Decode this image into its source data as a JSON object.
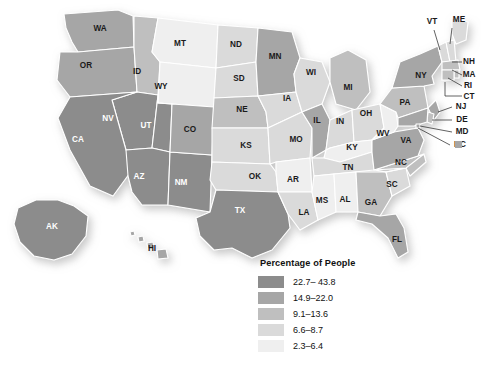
{
  "legend": {
    "title": "Percentage of People",
    "items": [
      {
        "label": "22.7– 43.8",
        "color": "#8c8c8c"
      },
      {
        "label": "14.9–22.0",
        "color": "#a6a6a6"
      },
      {
        "label": "9.1–13.6",
        "color": "#bfbfbf"
      },
      {
        "label": "6.6–8.7",
        "color": "#dadada"
      },
      {
        "label": "2.3–6.4",
        "color": "#efefef"
      }
    ]
  },
  "chart_data": {
    "type": "choropleth",
    "title": "Percentage of People",
    "xlabel": "",
    "ylabel": "",
    "units": "percent",
    "bins": [
      {
        "label": "22.7– 43.8",
        "min": 22.7,
        "max": 43.8,
        "color": "#8c8c8c"
      },
      {
        "label": "14.9–22.0",
        "min": 14.9,
        "max": 22.0,
        "color": "#a6a6a6"
      },
      {
        "label": "9.1–13.6",
        "min": 9.1,
        "max": 13.6,
        "color": "#bfbfbf"
      },
      {
        "label": "6.6–8.7",
        "min": 6.6,
        "max": 8.7,
        "color": "#dadada"
      },
      {
        "label": "2.3–6.4",
        "min": 2.3,
        "max": 6.4,
        "color": "#efefef"
      }
    ],
    "legend_position": "bottom-center",
    "grid": false,
    "regions": [
      {
        "code": "WA",
        "bin": 1
      },
      {
        "code": "OR",
        "bin": 1
      },
      {
        "code": "ID",
        "bin": 2
      },
      {
        "code": "MT",
        "bin": 4
      },
      {
        "code": "WY",
        "bin": 4
      },
      {
        "code": "CA",
        "bin": 0
      },
      {
        "code": "NV",
        "bin": 0
      },
      {
        "code": "UT",
        "bin": 0
      },
      {
        "code": "AZ",
        "bin": 0
      },
      {
        "code": "NM",
        "bin": 0
      },
      {
        "code": "CO",
        "bin": 1
      },
      {
        "code": "ND",
        "bin": 3
      },
      {
        "code": "SD",
        "bin": 3
      },
      {
        "code": "NE",
        "bin": 2
      },
      {
        "code": "KS",
        "bin": 3
      },
      {
        "code": "OK",
        "bin": 3
      },
      {
        "code": "TX",
        "bin": 0
      },
      {
        "code": "MN",
        "bin": 1
      },
      {
        "code": "IA",
        "bin": 3
      },
      {
        "code": "MO",
        "bin": 3
      },
      {
        "code": "AR",
        "bin": 4
      },
      {
        "code": "LA",
        "bin": 3
      },
      {
        "code": "WI",
        "bin": 3
      },
      {
        "code": "IL",
        "bin": 1
      },
      {
        "code": "MI",
        "bin": 2
      },
      {
        "code": "IN",
        "bin": 3
      },
      {
        "code": "OH",
        "bin": 3
      },
      {
        "code": "KY",
        "bin": 4
      },
      {
        "code": "TN",
        "bin": 3
      },
      {
        "code": "MS",
        "bin": 4
      },
      {
        "code": "AL",
        "bin": 4
      },
      {
        "code": "GA",
        "bin": 2
      },
      {
        "code": "FL",
        "bin": 1
      },
      {
        "code": "SC",
        "bin": 3
      },
      {
        "code": "NC",
        "bin": 2
      },
      {
        "code": "VA",
        "bin": 1
      },
      {
        "code": "WV",
        "bin": 4
      },
      {
        "code": "PA",
        "bin": 2
      },
      {
        "code": "NY",
        "bin": 1
      },
      {
        "code": "ME",
        "bin": 3
      },
      {
        "code": "VT",
        "bin": 3
      },
      {
        "code": "NH",
        "bin": 3
      },
      {
        "code": "MA",
        "bin": 2
      },
      {
        "code": "RI",
        "bin": 2
      },
      {
        "code": "CT",
        "bin": 2
      },
      {
        "code": "NJ",
        "bin": 1
      },
      {
        "code": "DE",
        "bin": 2
      },
      {
        "code": "MD",
        "bin": 1
      },
      {
        "code": "DC",
        "bin": 1
      },
      {
        "code": "AK",
        "bin": 0
      },
      {
        "code": "HI",
        "bin": 1
      }
    ]
  },
  "map": {
    "labels": [
      {
        "code": "WA",
        "x": 100,
        "y": 29
      },
      {
        "code": "OR",
        "x": 86,
        "y": 66
      },
      {
        "code": "ID",
        "x": 137,
        "y": 72
      },
      {
        "code": "MT",
        "x": 180,
        "y": 44
      },
      {
        "code": "WY",
        "x": 161,
        "y": 87
      },
      {
        "code": "NV",
        "x": 108,
        "y": 119
      },
      {
        "code": "CA",
        "x": 78,
        "y": 140
      },
      {
        "code": "UT",
        "x": 146,
        "y": 126
      },
      {
        "code": "AZ",
        "x": 139,
        "y": 177
      },
      {
        "code": "NM",
        "x": 181,
        "y": 183
      },
      {
        "code": "CO",
        "x": 190,
        "y": 130
      },
      {
        "code": "ND",
        "x": 236,
        "y": 45
      },
      {
        "code": "SD",
        "x": 239,
        "y": 79
      },
      {
        "code": "NE",
        "x": 242,
        "y": 110
      },
      {
        "code": "KS",
        "x": 246,
        "y": 146
      },
      {
        "code": "OK",
        "x": 255,
        "y": 177
      },
      {
        "code": "TX",
        "x": 240,
        "y": 211
      },
      {
        "code": "MN",
        "x": 275,
        "y": 57
      },
      {
        "code": "IA",
        "x": 287,
        "y": 99
      },
      {
        "code": "MO",
        "x": 296,
        "y": 140
      },
      {
        "code": "AR",
        "x": 293,
        "y": 180
      },
      {
        "code": "LA",
        "x": 304,
        "y": 213
      },
      {
        "code": "WI",
        "x": 311,
        "y": 73
      },
      {
        "code": "IL",
        "x": 317,
        "y": 121
      },
      {
        "code": "MI",
        "x": 348,
        "y": 88
      },
      {
        "code": "IN",
        "x": 340,
        "y": 122
      },
      {
        "code": "OH",
        "x": 366,
        "y": 114
      },
      {
        "code": "KY",
        "x": 352,
        "y": 148
      },
      {
        "code": "TN",
        "x": 348,
        "y": 168
      },
      {
        "code": "MS",
        "x": 322,
        "y": 201
      },
      {
        "code": "AL",
        "x": 345,
        "y": 200
      },
      {
        "code": "GA",
        "x": 371,
        "y": 203
      },
      {
        "code": "FL",
        "x": 397,
        "y": 240
      },
      {
        "code": "SC",
        "x": 392,
        "y": 185
      },
      {
        "code": "NC",
        "x": 401,
        "y": 163
      },
      {
        "code": "VA",
        "x": 406,
        "y": 141
      },
      {
        "code": "WV",
        "x": 383,
        "y": 134
      },
      {
        "code": "PA",
        "x": 405,
        "y": 103
      },
      {
        "code": "NY",
        "x": 421,
        "y": 76
      },
      {
        "code": "AK",
        "x": 52,
        "y": 227
      },
      {
        "code": "HI",
        "x": 152,
        "y": 249
      }
    ],
    "callouts": [
      {
        "code": "VT",
        "x": 432,
        "y": 22
      },
      {
        "code": "ME",
        "x": 459,
        "y": 20
      },
      {
        "code": "NH",
        "x": 469,
        "y": 62
      },
      {
        "code": "MA",
        "x": 469,
        "y": 75
      },
      {
        "code": "RI",
        "x": 468,
        "y": 86
      },
      {
        "code": "CT",
        "x": 469,
        "y": 97
      },
      {
        "code": "NJ",
        "x": 461,
        "y": 107
      },
      {
        "code": "DE",
        "x": 462,
        "y": 120
      },
      {
        "code": "MD",
        "x": 462,
        "y": 132
      },
      {
        "code": "DC",
        "x": 460,
        "y": 145
      }
    ]
  }
}
